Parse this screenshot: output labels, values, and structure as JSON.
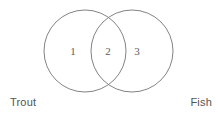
{
  "diagram": {
    "type": "venn",
    "sets": [
      {
        "id": "left",
        "label": "Trout"
      },
      {
        "id": "right",
        "label": "Fish"
      }
    ],
    "regions": [
      {
        "id": "left-only",
        "count": "1"
      },
      {
        "id": "intersection",
        "count": "2"
      },
      {
        "id": "right-only",
        "count": "3"
      }
    ],
    "colors": {
      "stroke": "#757575",
      "number": "#5c5c5c",
      "label": "#545454",
      "background": "#ffffff"
    }
  }
}
